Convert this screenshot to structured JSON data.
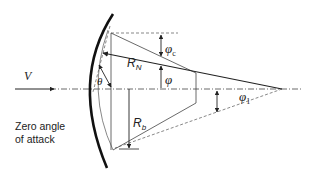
{
  "diagram": {
    "labels": {
      "velocity": "V",
      "theta": "θ",
      "nose_radius": "R",
      "nose_radius_sub": "N",
      "base_radius": "R",
      "base_radius_sub": "b",
      "cone_angle": "φ",
      "cone_angle_sub": "c",
      "phi": "φ",
      "phi1": "φ",
      "phi1_sub": "1",
      "caption_line1": "Zero angle",
      "caption_line2": "of attack"
    },
    "colors": {
      "stroke": "#222222",
      "background": "#ffffff"
    }
  }
}
